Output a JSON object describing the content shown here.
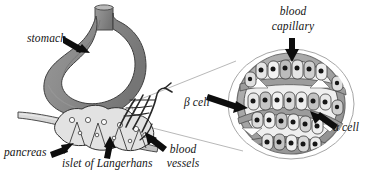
{
  "figure": {
    "type": "anatomical-diagram",
    "background_color": "#ffffff",
    "ink_color": "#151515"
  },
  "labels": {
    "stomach": "stomach",
    "pancreas": "pancreas",
    "islet": "islet of Langerhans",
    "blood_vessels_line1": "blood",
    "blood_vessels_line2": "vessels",
    "blood_capillary_line1": "blood",
    "blood_capillary_line2": "capillary",
    "beta_cell": "β cell",
    "alpha_cell": "α cell"
  },
  "colors": {
    "stomach_fill": "#8d8d8d",
    "stomach_shade": "#6f6f6f",
    "stomach_outline": "#4a4a4a",
    "pancreas_fill": "#d2d2d2",
    "pancreas_outline": "#3a3a3a",
    "vessel_outline": "#2b2b2b",
    "vessel_fill": "#e8e8e8",
    "circle_outline": "#8a8a8a",
    "islet_ring": "#9a9a9a",
    "islet_fill": "#efefef",
    "capillary_band": "#9c9c9c",
    "cell_fill": "#e4e4e4",
    "cell_fill_alt": "#bdbdbd",
    "nucleus": "#1a1a1a",
    "arrow": "#101010",
    "magnifier_line": "#9a9a9a"
  },
  "arrows": {
    "stomach_arrow": "arrow pointing right-down into stomach body",
    "pancreas_arrow": "arrow pointing right-up to pancreas",
    "islet_arrow": "arrow pointing up to islet",
    "vessels_arrow": "arrow pointing up-left to blood vessels",
    "capillary_arrow": "arrow pointing down into capillary",
    "beta_arrow": "arrow pointing right into beta cell",
    "alpha_arrow": "arrow pointing up-left to alpha cell"
  }
}
